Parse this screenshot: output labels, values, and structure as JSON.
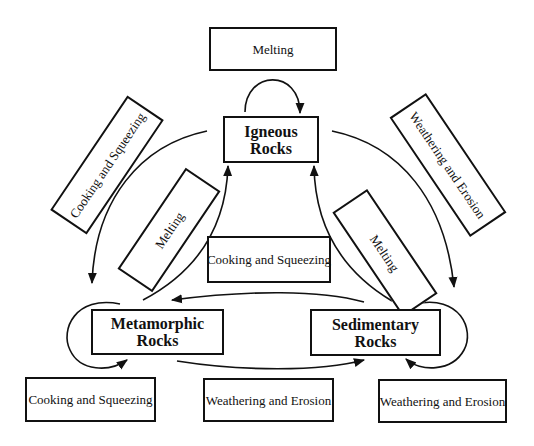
{
  "diagram": {
    "nodes": {
      "igneous": {
        "line1": "Igneous",
        "line2": "Rocks"
      },
      "metamorphic": {
        "line1": "Metamorphic",
        "line2": "Rocks"
      },
      "sedimentary": {
        "line1": "Sedimentary",
        "line2": "Rocks"
      }
    },
    "process_labels": {
      "top_melting": "Melting",
      "left_outer_cooking": "Cooking and Squeezing",
      "left_inner_melting": "Melting",
      "right_outer_weathering": "Weathering and Erosion",
      "right_inner_melting": "Melting",
      "center_cooking": "Cooking and Squeezing",
      "bottom_left_cooking": "Cooking and Squeezing",
      "bottom_center_weathering": "Weathering and Erosion",
      "bottom_right_weathering": "Weathering and Erosion"
    },
    "edges": [
      {
        "from": "Igneous Rocks",
        "to": "Igneous Rocks",
        "label": "Melting"
      },
      {
        "from": "Igneous Rocks",
        "to": "Metamorphic Rocks",
        "label": "Cooking and Squeezing"
      },
      {
        "from": "Metamorphic Rocks",
        "to": "Igneous Rocks",
        "label": "Melting"
      },
      {
        "from": "Igneous Rocks",
        "to": "Sedimentary Rocks",
        "label": "Weathering and Erosion"
      },
      {
        "from": "Sedimentary Rocks",
        "to": "Igneous Rocks",
        "label": "Melting"
      },
      {
        "from": "Sedimentary Rocks",
        "to": "Metamorphic Rocks",
        "label": "Cooking and Squeezing"
      },
      {
        "from": "Metamorphic Rocks",
        "to": "Metamorphic Rocks",
        "label": "Cooking and Squeezing"
      },
      {
        "from": "Metamorphic Rocks",
        "to": "Sedimentary Rocks",
        "label": "Weathering and Erosion"
      },
      {
        "from": "Sedimentary Rocks",
        "to": "Sedimentary Rocks",
        "label": "Weathering and Erosion"
      }
    ],
    "colors": {
      "stroke": "#111111",
      "background": "#ffffff"
    }
  }
}
